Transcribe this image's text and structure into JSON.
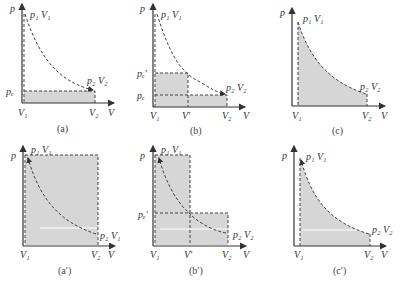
{
  "figure": {
    "panels": [
      {
        "id": "a",
        "caption": "(a)",
        "p_label": "p",
        "v_label": "V",
        "state1": "p₁ V₁",
        "state2": "p₂ V₂",
        "v1": "V₁",
        "v2": "V₂",
        "pe": "pₑ",
        "description": "Work against constant external pressure p_e from V1 to V2"
      },
      {
        "id": "b",
        "caption": "(b)",
        "p_label": "p",
        "v_label": "V",
        "state1": "p₁ V₁",
        "state2": "p₂ V₂",
        "v1": "V₁",
        "vprime": "V′",
        "v2": "V₂",
        "pe": "pₑ",
        "pe_prime": "pₑ′",
        "description": "Two-step expansion: p_e' from V1 to V', then p_e from V' to V2"
      },
      {
        "id": "c",
        "caption": "(c)",
        "p_label": "p",
        "v_label": "V",
        "state1": "p₁ V₁",
        "state2": "p₂ V₂",
        "v1": "V₁",
        "v2": "V₂",
        "description": "Reversible expansion: area under isotherm"
      },
      {
        "id": "a_prime",
        "caption": "(a′)",
        "p_label": "p",
        "v_label": "V",
        "state1": "p₁ V₁",
        "state2": "p₂ V₁",
        "v1": "V₁",
        "v2": "V₂",
        "description": "One-step compression at p1"
      },
      {
        "id": "b_prime",
        "caption": "(b′)",
        "p_label": "p",
        "v_label": "V",
        "state1": "p₁ V₁",
        "state2": "p₂ V₂",
        "v1": "V₁",
        "vprime": "V′",
        "v2": "V₂",
        "pe_prime": "pₑ′",
        "description": "Two-step compression"
      },
      {
        "id": "c_prime",
        "caption": "(c′)",
        "p_label": "p",
        "v_label": "V",
        "state1": "p₁ V₁",
        "state2": "p₂ V₂",
        "v1": "V₁",
        "v2": "V₂",
        "description": "Reversible compression"
      }
    ]
  }
}
